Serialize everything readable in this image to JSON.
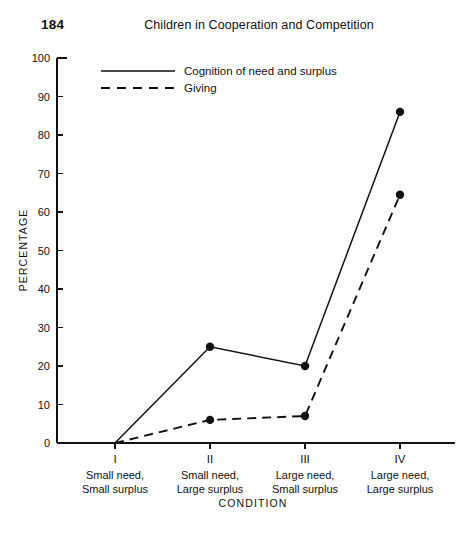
{
  "header": {
    "page_number": "184",
    "title": "Children in Cooperation and Competition"
  },
  "chart_data": {
    "type": "line",
    "title": "",
    "xlabel": "CONDITION",
    "ylabel": "PERCENTAGE",
    "ylim": [
      0,
      100
    ],
    "yticks": [
      0,
      10,
      20,
      30,
      40,
      50,
      60,
      70,
      80,
      90,
      100
    ],
    "ytick_labels": [
      "0",
      "10",
      "20",
      "30",
      "40",
      "50",
      "60",
      "70",
      "80",
      "90",
      "100"
    ],
    "grid": false,
    "legend_position": "top-left-inside",
    "categories": [
      "I",
      "II",
      "III",
      "IV"
    ],
    "category_sublabels": [
      [
        "Small need,",
        "Small surplus"
      ],
      [
        "Small need,",
        "Large surplus"
      ],
      [
        "Large need,",
        "Small surplus"
      ],
      [
        "Large need,",
        "Large surplus"
      ]
    ],
    "series": [
      {
        "name": "Cognition of need and surplus",
        "style": "solid",
        "color": "#111111",
        "values": [
          0,
          25,
          20,
          86
        ],
        "markers": [
          false,
          true,
          true,
          true
        ]
      },
      {
        "name": "Giving",
        "style": "dashed",
        "color": "#111111",
        "values": [
          0,
          6,
          7,
          64.5
        ],
        "markers": [
          false,
          true,
          true,
          true
        ]
      }
    ]
  }
}
